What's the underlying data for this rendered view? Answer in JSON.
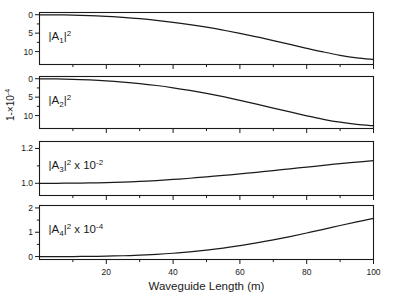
{
  "figure": {
    "yaxis_label_parts": {
      "base": "1-×10",
      "exponent": "-4"
    },
    "xaxis_title": "Waveguide Length (m)",
    "xaxis_ticklabels": [
      "20",
      "40",
      "60",
      "80",
      "100"
    ],
    "background_color": "#ffffff",
    "line_color": "#1a1a1a"
  },
  "chart_data": {
    "type": "line",
    "title": "",
    "xlabel": "Waveguide Length (m)",
    "ylabel": "1-×10^-4",
    "xlim": [
      0,
      100
    ],
    "xticks": [
      20,
      40,
      60,
      80,
      100
    ],
    "grid": false,
    "legend": "none",
    "shared_x": true,
    "panels": [
      {
        "id": "panel-a1",
        "label": "|A₁|²",
        "label_base": "|A",
        "label_sub": "1",
        "label_sup": "2",
        "label_suffix": "",
        "ylabel_note": "1-×10^-4",
        "ylim": [
          13.5,
          -0.6
        ],
        "y_inverted": true,
        "yticks": [
          0,
          5,
          10
        ],
        "yticklabels": [
          "0",
          "5",
          "10"
        ],
        "x": [
          0,
          5,
          10,
          15,
          20,
          25,
          30,
          35,
          40,
          45,
          50,
          55,
          60,
          65,
          70,
          75,
          80,
          85,
          90,
          95,
          100
        ],
        "y": [
          0.02,
          0.05,
          0.12,
          0.25,
          0.45,
          0.73,
          1.08,
          1.52,
          2.05,
          2.68,
          3.38,
          4.18,
          5.05,
          6.0,
          7.0,
          8.05,
          9.1,
          10.1,
          11.0,
          11.7,
          12.15
        ]
      },
      {
        "id": "panel-a2",
        "label": "|A₂|²",
        "label_base": "|A",
        "label_sub": "2",
        "label_sup": "2",
        "label_suffix": "",
        "ylabel_note": "1-×10^-4",
        "ylim": [
          13.5,
          -0.6
        ],
        "y_inverted": true,
        "yticks": [
          0,
          5,
          10
        ],
        "yticklabels": [
          "0",
          "5",
          "10"
        ],
        "x": [
          0,
          5,
          10,
          15,
          20,
          25,
          30,
          35,
          40,
          45,
          50,
          55,
          60,
          65,
          70,
          75,
          80,
          85,
          90,
          95,
          100
        ],
        "y": [
          0.03,
          0.07,
          0.16,
          0.32,
          0.56,
          0.9,
          1.32,
          1.84,
          2.46,
          3.18,
          3.98,
          4.88,
          5.85,
          6.88,
          7.95,
          9.02,
          10.05,
          11.0,
          11.8,
          12.4,
          12.75
        ]
      },
      {
        "id": "panel-a3",
        "label": "|A₃|² x 10⁻²",
        "label_base": "|A",
        "label_sub": "3",
        "label_sup": "2",
        "label_suffix": " x 10",
        "label_suffix_sup": "-2",
        "ylim": [
          0.93,
          1.24
        ],
        "y_inverted": false,
        "yticks": [
          1.0,
          1.2
        ],
        "yticklabels": [
          "1.0",
          "1.2"
        ],
        "x": [
          0,
          5,
          10,
          15,
          20,
          25,
          30,
          35,
          40,
          45,
          50,
          55,
          60,
          65,
          70,
          75,
          80,
          85,
          90,
          95,
          100
        ],
        "y": [
          1.0,
          1.0,
          1.001,
          1.002,
          1.004,
          1.007,
          1.011,
          1.016,
          1.022,
          1.029,
          1.037,
          1.045,
          1.054,
          1.063,
          1.073,
          1.083,
          1.093,
          1.103,
          1.113,
          1.122,
          1.13
        ]
      },
      {
        "id": "panel-a4",
        "label": "|A₄|² x 10⁻⁴",
        "label_base": "|A",
        "label_sub": "4",
        "label_sup": "2",
        "label_suffix": " x 10",
        "label_suffix_sup": "-4",
        "ylim": [
          -0.12,
          2.1
        ],
        "y_inverted": false,
        "yticks": [
          0,
          1,
          2
        ],
        "yticklabels": [
          "0",
          "1",
          "2"
        ],
        "x": [
          0,
          5,
          10,
          15,
          20,
          25,
          30,
          35,
          40,
          45,
          50,
          55,
          60,
          65,
          70,
          75,
          80,
          85,
          90,
          95,
          100
        ],
        "y": [
          0.0,
          0.001,
          0.003,
          0.008,
          0.018,
          0.034,
          0.058,
          0.092,
          0.137,
          0.195,
          0.266,
          0.351,
          0.45,
          0.562,
          0.687,
          0.824,
          0.97,
          1.122,
          1.278,
          1.43,
          1.57
        ]
      }
    ]
  }
}
